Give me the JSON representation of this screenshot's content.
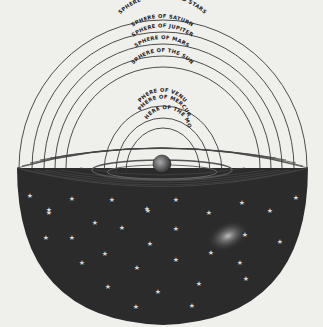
{
  "diagram": {
    "type": "geocentric celestial spheres",
    "colors": {
      "background": "#efefec",
      "line": "#3a3a3a",
      "hemisphere": "#2b2b2b",
      "star": "#d8d8d8",
      "earth": "#555555"
    },
    "center": {
      "label": "Earth"
    },
    "spheres": [
      {
        "label": "SPHERE OF THE FIXED STARS"
      },
      {
        "label": "SPHERE OF SATURN"
      },
      {
        "label": "SPHERE OF JUPITER"
      },
      {
        "label": "SPHERE OF MARS"
      },
      {
        "label": "SPHERE OF THE SUN"
      },
      {
        "label": "SPHERE OF VENUS"
      },
      {
        "label": "SPHERE OF MERCURY"
      },
      {
        "label": "SPHERE OF THE MOON"
      }
    ]
  }
}
